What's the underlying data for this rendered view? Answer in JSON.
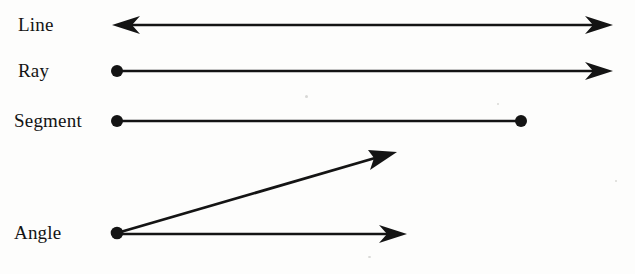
{
  "figure": {
    "background_color": "#fdfdfc",
    "ink_color": "#141414",
    "rows": [
      {
        "id": "line",
        "label": "Line",
        "type": "line",
        "description": "A straight path extending without end in both directions, drawn with an arrowhead at each end.",
        "endpoints": [
          {
            "kind": "arrowhead",
            "x": 112,
            "y": 25
          },
          {
            "kind": "arrowhead",
            "x": 613,
            "y": 25
          }
        ]
      },
      {
        "id": "ray",
        "label": "Ray",
        "type": "ray",
        "description": "A straight path with one endpoint that extends without end in one direction.",
        "endpoints": [
          {
            "kind": "dot",
            "x": 117,
            "y": 71
          },
          {
            "kind": "arrowhead",
            "x": 613,
            "y": 71
          }
        ]
      },
      {
        "id": "segment",
        "label": "Segment",
        "type": "segment",
        "description": "A straight path bounded by two endpoints.",
        "endpoints": [
          {
            "kind": "dot",
            "x": 117,
            "y": 121
          },
          {
            "kind": "dot",
            "x": 521,
            "y": 121
          }
        ]
      },
      {
        "id": "angle",
        "label": "Angle",
        "type": "angle",
        "description": "Two rays sharing a common endpoint called the vertex.",
        "vertex": {
          "kind": "dot",
          "x": 117,
          "y": 233
        },
        "endpoints": [
          {
            "kind": "arrowhead",
            "x": 397,
            "y": 152
          },
          {
            "kind": "arrowhead",
            "x": 407,
            "y": 234
          }
        ]
      }
    ],
    "stroke_width_px": 2.6,
    "dot_radius_px": 6.0,
    "arrowhead_length_px": 26,
    "arrowhead_half_width_px": 9
  }
}
